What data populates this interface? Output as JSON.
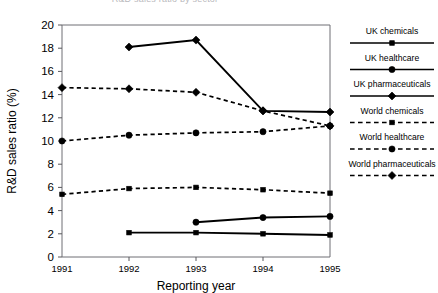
{
  "chart_data": {
    "type": "line",
    "title": "R&D sales ratio by sector",
    "xlabel": "Reporting year",
    "ylabel": "R&D sales ratio (%)",
    "x": [
      "1991",
      "1992",
      "1993",
      "1994",
      "1995"
    ],
    "xticklabels": [
      "1991",
      "1992",
      "1993",
      "1994",
      "1995"
    ],
    "yticklabels": [
      "0",
      "2",
      "4",
      "6",
      "8",
      "10",
      "12",
      "14",
      "16",
      "18",
      "20"
    ],
    "ylim": [
      0,
      20
    ],
    "ytick_step": 2,
    "grid": false,
    "legend_position": "right",
    "series": [
      {
        "name": "UK chemicals",
        "marker": "square",
        "linestyle": "solid",
        "values": [
          null,
          2.1,
          2.1,
          2.0,
          1.9
        ]
      },
      {
        "name": "UK healthcare",
        "marker": "circle",
        "linestyle": "solid",
        "values": [
          null,
          null,
          3.0,
          3.4,
          3.5
        ]
      },
      {
        "name": "UK pharmaceuticals",
        "marker": "diamond",
        "linestyle": "solid",
        "values": [
          null,
          18.1,
          18.7,
          12.6,
          12.5
        ]
      },
      {
        "name": "World chemicals",
        "marker": "square",
        "linestyle": "dashed",
        "values": [
          5.4,
          5.9,
          6.0,
          5.8,
          5.5
        ]
      },
      {
        "name": "World healthcare",
        "marker": "circle",
        "linestyle": "dashed",
        "values": [
          10.0,
          10.5,
          10.7,
          10.8,
          11.3
        ]
      },
      {
        "name": "World pharmaceuticals",
        "marker": "diamond",
        "linestyle": "dashed",
        "values": [
          14.6,
          14.5,
          14.2,
          12.6,
          11.3
        ]
      }
    ]
  },
  "legend": {
    "entries": [
      {
        "label": "UK chemicals",
        "marker": "square",
        "linestyle": "solid"
      },
      {
        "label": "UK healthcare",
        "marker": "circle",
        "linestyle": "solid"
      },
      {
        "label": "UK pharmaceuticals",
        "marker": "diamond",
        "linestyle": "solid"
      },
      {
        "label": "World chemicals",
        "marker": "square",
        "linestyle": "dashed"
      },
      {
        "label": "World healthcare",
        "marker": "circle",
        "linestyle": "dashed"
      },
      {
        "label": "World pharmaceuticals",
        "marker": "diamond",
        "linestyle": "dashed"
      }
    ]
  },
  "colors": {
    "ink": "#000000",
    "axis": "#6f6f74",
    "background": "#ffffff",
    "title": "#b9b9bd"
  }
}
